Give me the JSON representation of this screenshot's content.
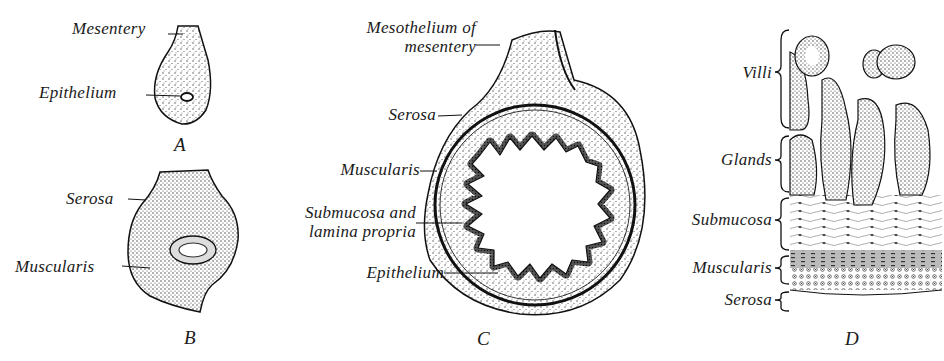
{
  "figure": {
    "panels": [
      {
        "id": "A",
        "letter": "A",
        "labels": {
          "mesentery": "Mesentery",
          "epithelium": "Epithelium"
        }
      },
      {
        "id": "B",
        "letter": "B",
        "labels": {
          "serosa": "Serosa",
          "muscularis": "Muscularis"
        }
      },
      {
        "id": "C",
        "letter": "C",
        "labels": {
          "mesothelium_1": "Mesothelium of",
          "mesothelium_2": "mesentery",
          "serosa": "Serosa",
          "muscularis": "Muscularis",
          "submucosa_1": "Submucosa and",
          "submucosa_2": "lamina propria",
          "epithelium": "Epithelium"
        }
      },
      {
        "id": "D",
        "letter": "D",
        "labels": {
          "villi": "Villi",
          "glands": "Glands",
          "submucosa": "Submucosa",
          "muscularis": "Muscularis",
          "serosa": "Serosa"
        }
      }
    ],
    "colors": {
      "ink": "#1a1a1a",
      "background": "#ffffff",
      "stipple": "#555555"
    }
  }
}
